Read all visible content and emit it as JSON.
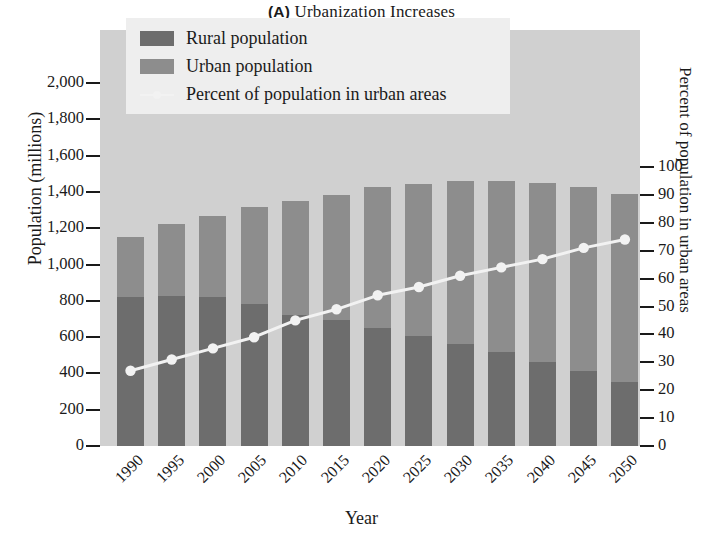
{
  "title": {
    "panel": "(A)",
    "text": "Urbanization Increases"
  },
  "legend": {
    "items": [
      {
        "label": "Rural population",
        "marker": "swatch",
        "color": "#6d6d6d"
      },
      {
        "label": "Urban population",
        "marker": "swatch",
        "color": "#8d8d8d"
      },
      {
        "label": "Percent of population in urban areas",
        "marker": "line",
        "color": "#f2f2f2"
      }
    ]
  },
  "axes": {
    "left": {
      "title": "Population (millions)",
      "ticks": [
        "2,000",
        "1,800",
        "1,600",
        "1,400",
        "1,200",
        "1,000",
        "800",
        "600",
        "400",
        "200",
        "0"
      ],
      "min": 0,
      "max": 2000
    },
    "right": {
      "title": "Percent of population in urban areas",
      "ticks": [
        "100",
        "90",
        "80",
        "70",
        "60",
        "50",
        "40",
        "30",
        "20",
        "10",
        "0"
      ],
      "min": 0,
      "max": 100
    },
    "x": {
      "title": "Year",
      "ticks": [
        "1990",
        "1995",
        "2000",
        "2005",
        "2010",
        "2015",
        "2020",
        "2025",
        "2030",
        "2035",
        "2040",
        "2045",
        "2050"
      ]
    }
  },
  "chart_data": {
    "type": "bar",
    "title": "(A) Urbanization Increases",
    "xlabel": "Year",
    "ylabel": "Population (millions)",
    "y2label": "Percent of population in urban areas",
    "ylim": [
      0,
      2000
    ],
    "y2lim": [
      0,
      100
    ],
    "grid": false,
    "legend_position": "top-center",
    "stacked": true,
    "categories": [
      "1990",
      "1995",
      "2000",
      "2005",
      "2010",
      "2015",
      "2020",
      "2025",
      "2030",
      "2035",
      "2040",
      "2045",
      "2050"
    ],
    "series": [
      {
        "name": "Rural population",
        "type": "bar",
        "axis": "left",
        "color": "#6d6d6d",
        "values": [
          820,
          825,
          822,
          785,
          720,
          695,
          650,
          605,
          560,
          520,
          465,
          415,
          355
        ]
      },
      {
        "name": "Urban population",
        "type": "bar",
        "axis": "left",
        "color": "#8d8d8d",
        "values": [
          330,
          400,
          445,
          530,
          630,
          690,
          775,
          840,
          900,
          940,
          985,
          1010,
          1035
        ]
      },
      {
        "name": "Total population",
        "type": "derived",
        "axis": "left",
        "values": [
          1150,
          1225,
          1267,
          1315,
          1350,
          1385,
          1425,
          1445,
          1460,
          1460,
          1450,
          1425,
          1390
        ]
      },
      {
        "name": "Percent of population in urban areas",
        "type": "line",
        "axis": "right",
        "color": "#f2f2f2",
        "values": [
          27,
          31,
          35,
          39,
          45,
          49,
          54,
          57,
          61,
          64,
          67,
          71,
          74
        ]
      }
    ]
  }
}
